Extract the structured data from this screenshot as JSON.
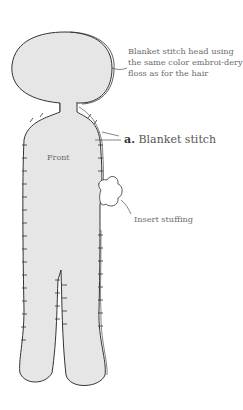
{
  "diagram": {
    "piece_label": "Front",
    "annotations": {
      "head_note": "Blanket stitch head using the same color embroi-dery floss as for the hair",
      "stitch_marker": "a.",
      "stitch_name": "Blanket stitch",
      "stuffing_note": "Insert stuffing"
    },
    "colors": {
      "body_fill": "#e6e6e6",
      "outline": "#333333",
      "text": "#6b6b6b"
    }
  }
}
